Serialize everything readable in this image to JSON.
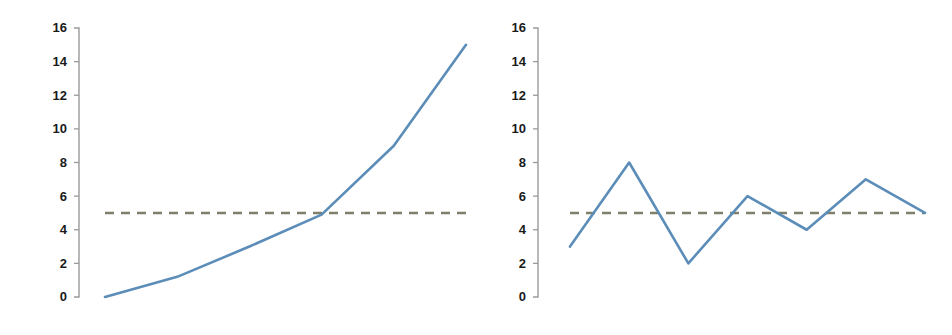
{
  "figure": {
    "background_color": "#ffffff",
    "width": 952,
    "height": 335,
    "panel_count": 2
  },
  "style": {
    "series_color": "#5b8db8",
    "threshold_color": "#7f7f6b",
    "axis_color": "#9a9a9a",
    "tick_label_color": "#1a1a1a"
  },
  "chart_data": [
    {
      "type": "line",
      "title": "",
      "subtitle": "",
      "xlabel": "",
      "ylabel": "",
      "x": [
        0,
        1,
        2,
        3,
        4,
        5
      ],
      "values": [
        0,
        1.2,
        3,
        4.9,
        9,
        15
      ],
      "series": [
        {
          "name": "trend",
          "values": [
            0,
            1.2,
            3,
            4.9,
            9,
            15
          ]
        }
      ],
      "annotations": [
        {
          "name": "threshold",
          "type": "hline",
          "y": 5,
          "style": "dashed",
          "color": "#7f7f6b"
        }
      ],
      "ytick_labels": [
        "16",
        "14",
        "12",
        "10",
        "8",
        "6",
        "4",
        "2",
        "0"
      ],
      "yticks": [
        16,
        14,
        12,
        10,
        8,
        6,
        4,
        2,
        0
      ],
      "ylim": [
        0,
        16
      ],
      "xlim": [
        0,
        5
      ],
      "xtick_labels": [],
      "grid": false,
      "legend": false,
      "legend_position": "none"
    },
    {
      "type": "line",
      "title": "",
      "subtitle": "",
      "xlabel": "",
      "ylabel": "",
      "x": [
        0,
        1,
        2,
        3,
        4,
        5,
        6
      ],
      "values": [
        3,
        8,
        2,
        6,
        4,
        7,
        5
      ],
      "series": [
        {
          "name": "variation",
          "values": [
            3,
            8,
            2,
            6,
            4,
            7,
            5
          ]
        }
      ],
      "annotations": [
        {
          "name": "threshold",
          "type": "hline",
          "y": 5,
          "style": "dashed",
          "color": "#7f7f6b"
        }
      ],
      "ytick_labels": [
        "16",
        "14",
        "12",
        "10",
        "8",
        "6",
        "4",
        "2",
        "0"
      ],
      "yticks": [
        16,
        14,
        12,
        10,
        8,
        6,
        4,
        2,
        0
      ],
      "ylim": [
        0,
        16
      ],
      "xlim": [
        0,
        6
      ],
      "xtick_labels": [],
      "grid": false,
      "legend": false,
      "legend_position": "none"
    }
  ],
  "panels": {
    "left": {
      "name": "left-chart",
      "ytick_labels": [
        "16",
        "14",
        "12",
        "10",
        "8",
        "6",
        "4",
        "2",
        "0"
      ]
    },
    "right": {
      "name": "right-chart",
      "ytick_labels": [
        "16",
        "14",
        "12",
        "10",
        "8",
        "6",
        "4",
        "2",
        "0"
      ]
    }
  }
}
